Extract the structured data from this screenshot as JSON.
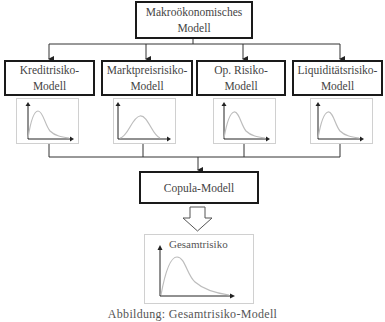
{
  "diagram": {
    "top": {
      "label": "Makroökonomisches Modell",
      "line1": "Makroökonomisches",
      "line2": "Modell"
    },
    "risk_models": [
      {
        "line1": "Kreditrisiko-",
        "line2": "Modell"
      },
      {
        "line1": "Marktpreisrisiko-",
        "line2": "Modell"
      },
      {
        "line1": "Op. Risiko-",
        "line2": "Modell"
      },
      {
        "line1": "Liquiditätsrisiko-",
        "line2": "Modell"
      }
    ],
    "distribution_icons": [
      "right-skewed-density",
      "symmetric-density",
      "right-skewed-density",
      "right-skewed-density"
    ],
    "copula": {
      "label": "Copula-Modell"
    },
    "aggregate": {
      "label": "Gesamtrisiko"
    },
    "caption": "Abbildung: Gesamtrisiko-Modell"
  },
  "colors": {
    "box_border": "#1a1a1a",
    "chart_border": "#d0d0d0",
    "curve": "#bdbdbd",
    "connector": "#333333"
  }
}
